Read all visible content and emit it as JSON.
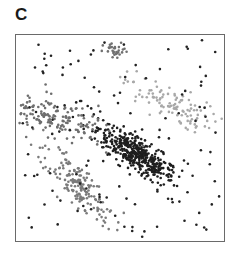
{
  "figure": {
    "panel_label": "C"
  },
  "chart_data": {
    "type": "scatter",
    "title": "",
    "panel_label": "C",
    "xlabel": "",
    "ylabel": "",
    "axes_visible": false,
    "frame": true,
    "grid": false,
    "legend": null,
    "xlim": [
      0,
      1
    ],
    "ylim": [
      0,
      1
    ],
    "series": [
      {
        "name": "cluster-dense-diagonal",
        "color": "#1e1e1e",
        "n": 420,
        "center": [
          0.58,
          0.42
        ],
        "spread": [
          0.11,
          0.035
        ],
        "angle_deg": -35
      },
      {
        "name": "cluster-left-upper",
        "color": "#6e6e6e",
        "n": 150,
        "center": [
          0.19,
          0.6
        ],
        "spread": [
          0.045,
          0.11
        ],
        "angle_deg": 75
      },
      {
        "name": "cluster-left-lower",
        "color": "#7a7a7a",
        "n": 170,
        "center": [
          0.3,
          0.27
        ],
        "spread": [
          0.12,
          0.04
        ],
        "angle_deg": -50
      },
      {
        "name": "cluster-right-light",
        "color": "#a8a8a8",
        "n": 110,
        "center": [
          0.73,
          0.67
        ],
        "spread": [
          0.12,
          0.04
        ],
        "angle_deg": -25
      },
      {
        "name": "cluster-top-small",
        "color": "#707070",
        "n": 30,
        "center": [
          0.48,
          0.92
        ],
        "spread": [
          0.03,
          0.02
        ],
        "angle_deg": 0
      },
      {
        "name": "background-noise",
        "color": "#222222",
        "n": 130,
        "distribution": "uniform"
      }
    ]
  }
}
